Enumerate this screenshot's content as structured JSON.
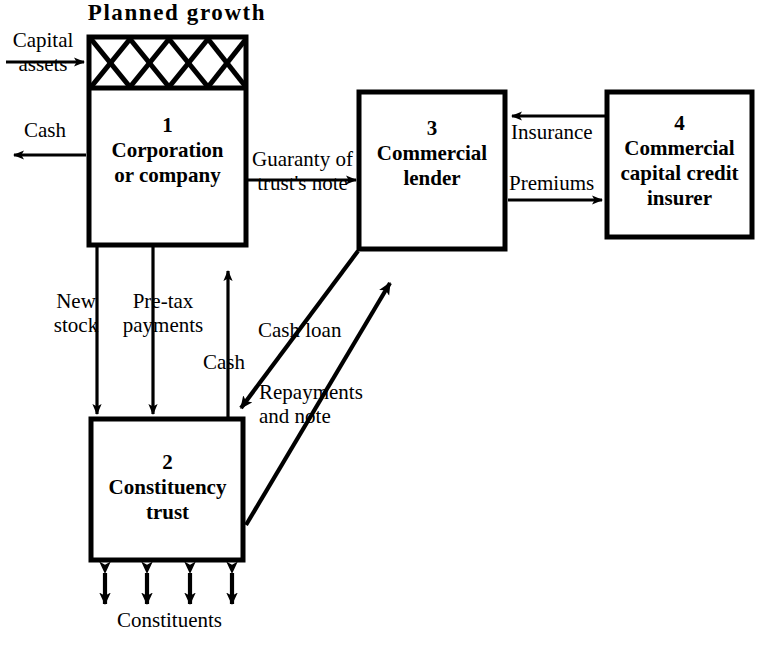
{
  "diagram": {
    "title": "Planned growth",
    "boxes": [
      {
        "id": "box-1",
        "number": "1",
        "line1": "Corporation",
        "line2": "or company",
        "line3": ""
      },
      {
        "id": "box-2",
        "number": "2",
        "line1": "Constituency",
        "line2": "trust",
        "line3": ""
      },
      {
        "id": "box-3",
        "number": "3",
        "line1": "Commercial",
        "line2": "lender",
        "line3": ""
      },
      {
        "id": "box-4",
        "number": "4",
        "line1": "Commercial",
        "line2": "capital credit",
        "line3": "insurer"
      }
    ],
    "flows": {
      "capital_assets_l1": "Capital",
      "capital_assets_l2": "assets",
      "cash_out": "Cash",
      "guaranty_l1": "Guaranty of",
      "guaranty_l2": "trust's note",
      "insurance": "Insurance",
      "premiums": "Premiums",
      "new_stock_l1": "New",
      "new_stock_l2": "stock",
      "pretax_l1": "Pre-tax",
      "pretax_l2": "payments",
      "cash_up": "Cash",
      "cash_loan": "Cash loan",
      "repayments_l1": "Repayments",
      "repayments_l2": "and note",
      "constituents": "Constituents"
    },
    "colors": {
      "stroke": "#000000",
      "fill": "#ffffff",
      "background": "#ffffff"
    }
  }
}
